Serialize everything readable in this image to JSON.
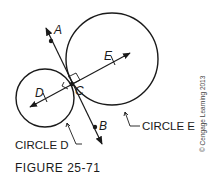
{
  "figure": {
    "caption": "FIGURE 25-71",
    "copyright": "© Cengage Learning 2013"
  },
  "points": {
    "A": "A",
    "B": "B",
    "C": "C",
    "D": "D",
    "E": "E"
  },
  "circles": {
    "d_label": "CIRCLE D",
    "e_label": "CIRCLE E"
  },
  "colors": {
    "stroke": "#1a1a1a",
    "background": "#ffffff"
  }
}
